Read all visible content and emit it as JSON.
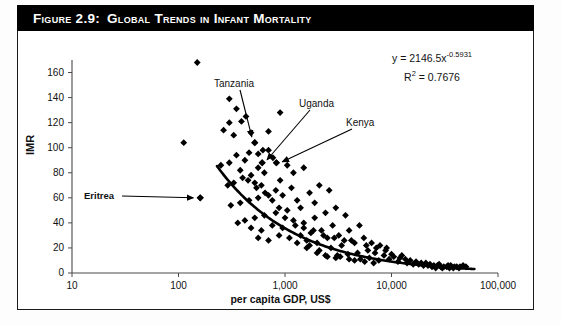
{
  "figure": {
    "number_label": "Figure 2.9:",
    "title": "Global Trends in Infant Mortality",
    "banner_color": "#000000",
    "banner_text_color": "#ffffff"
  },
  "equation": {
    "line1_prefix": "y = 2146.5x",
    "line1_exponent": "-0.5931",
    "line2_prefix": "R",
    "line2_exponent": "2",
    "line2_suffix": " = 0.7676"
  },
  "annotations": [
    {
      "name": "tanzania",
      "label": "Tanzania",
      "bold": false
    },
    {
      "name": "uganda",
      "label": "Uganda",
      "bold": false
    },
    {
      "name": "kenya",
      "label": "Kenya",
      "bold": false
    },
    {
      "name": "eritrea",
      "label": "Eritrea",
      "bold": true
    }
  ],
  "chart_data": {
    "type": "scatter",
    "title": "Global Trends in Infant Mortality",
    "xlabel": "per capita GDP, US$",
    "ylabel": "IMR",
    "xscale": "log",
    "yscale": "linear",
    "xlim": [
      10,
      100000
    ],
    "ylim": [
      0,
      170
    ],
    "xticks": [
      10,
      100,
      1000,
      10000,
      100000
    ],
    "xticklabels": [
      "10",
      "100",
      "1,000",
      "10,000",
      "100,000"
    ],
    "yticks": [
      0,
      20,
      40,
      60,
      80,
      100,
      120,
      140,
      160
    ],
    "yticklabels": [
      "0",
      "20",
      "40",
      "60",
      "80",
      "100",
      "120",
      "140",
      "160"
    ],
    "grid": false,
    "legend": "none",
    "marker": "diamond",
    "marker_color": "#000000",
    "trendline": {
      "type": "power",
      "equation": "y = 2146.5x^-0.5931",
      "r_squared": 0.7676,
      "coefficient": 2146.5,
      "exponent": -0.5931,
      "color": "#000000",
      "x_start": 230,
      "x_end": 60000
    },
    "annotated_points": [
      {
        "label": "Tanzania",
        "x": 520,
        "y": 104
      },
      {
        "label": "Uganda",
        "x": 610,
        "y": 88
      },
      {
        "label": "Kenya",
        "x": 830,
        "y": 88
      },
      {
        "label": "Eritrea",
        "x": 160,
        "y": 60
      }
    ],
    "points": [
      [
        150,
        168
      ],
      [
        112,
        104
      ],
      [
        160,
        60
      ],
      [
        300,
        139
      ],
      [
        350,
        131
      ],
      [
        300,
        120
      ],
      [
        390,
        121
      ],
      [
        430,
        125
      ],
      [
        265,
        114
      ],
      [
        330,
        110
      ],
      [
        520,
        104
      ],
      [
        480,
        112
      ],
      [
        610,
        88
      ],
      [
        830,
        88
      ],
      [
        700,
        113
      ],
      [
        900,
        128
      ],
      [
        620,
        98
      ],
      [
        560,
        95
      ],
      [
        460,
        96
      ],
      [
        420,
        90
      ],
      [
        350,
        94
      ],
      [
        300,
        88
      ],
      [
        250,
        86
      ],
      [
        700,
        98
      ],
      [
        770,
        92
      ],
      [
        560,
        84
      ],
      [
        640,
        80
      ],
      [
        480,
        78
      ],
      [
        400,
        76
      ],
      [
        330,
        72
      ],
      [
        290,
        70
      ],
      [
        520,
        72
      ],
      [
        600,
        70
      ],
      [
        900,
        74
      ],
      [
        1050,
        86
      ],
      [
        1200,
        80
      ],
      [
        820,
        66
      ],
      [
        700,
        62
      ],
      [
        560,
        60
      ],
      [
        460,
        58
      ],
      [
        380,
        56
      ],
      [
        310,
        54
      ],
      [
        1500,
        84
      ],
      [
        1150,
        68
      ],
      [
        950,
        62
      ],
      [
        1300,
        58
      ],
      [
        1700,
        64
      ],
      [
        2100,
        70
      ],
      [
        2600,
        66
      ],
      [
        1900,
        56
      ],
      [
        1400,
        52
      ],
      [
        1050,
        50
      ],
      [
        820,
        48
      ],
      [
        640,
        46
      ],
      [
        520,
        44
      ],
      [
        420,
        42
      ],
      [
        360,
        40
      ],
      [
        480,
        36
      ],
      [
        600,
        34
      ],
      [
        760,
        38
      ],
      [
        950,
        36
      ],
      [
        1200,
        42
      ],
      [
        1500,
        40
      ],
      [
        1900,
        44
      ],
      [
        2400,
        48
      ],
      [
        3000,
        52
      ],
      [
        3700,
        46
      ],
      [
        2800,
        38
      ],
      [
        2200,
        34
      ],
      [
        1750,
        32
      ],
      [
        1400,
        30
      ],
      [
        1100,
        28
      ],
      [
        880,
        30
      ],
      [
        700,
        26
      ],
      [
        560,
        28
      ],
      [
        1600,
        26
      ],
      [
        2000,
        24
      ],
      [
        2500,
        28
      ],
      [
        3200,
        30
      ],
      [
        4000,
        34
      ],
      [
        5000,
        38
      ],
      [
        4200,
        26
      ],
      [
        3400,
        22
      ],
      [
        2700,
        20
      ],
      [
        2100,
        18
      ],
      [
        1700,
        22
      ],
      [
        5500,
        28
      ],
      [
        6500,
        24
      ],
      [
        7800,
        22
      ],
      [
        9000,
        20
      ],
      [
        6000,
        18
      ],
      [
        4800,
        16
      ],
      [
        3900,
        15
      ],
      [
        3100,
        14
      ],
      [
        2500,
        13
      ],
      [
        7000,
        16
      ],
      [
        8500,
        14
      ],
      [
        10500,
        13
      ],
      [
        12000,
        12
      ],
      [
        9500,
        11
      ],
      [
        7600,
        10
      ],
      [
        6200,
        12
      ],
      [
        5100,
        11
      ],
      [
        13500,
        11
      ],
      [
        15000,
        10
      ],
      [
        17000,
        9
      ],
      [
        19000,
        8
      ],
      [
        21000,
        8
      ],
      [
        16000,
        7
      ],
      [
        14000,
        8
      ],
      [
        11500,
        9
      ],
      [
        23000,
        7
      ],
      [
        25000,
        6
      ],
      [
        27000,
        6
      ],
      [
        29000,
        5
      ],
      [
        31000,
        5
      ],
      [
        24000,
        5
      ],
      [
        22000,
        6
      ],
      [
        20000,
        6
      ],
      [
        18000,
        7
      ],
      [
        33000,
        5
      ],
      [
        35000,
        4
      ],
      [
        38000,
        4
      ],
      [
        41000,
        5
      ],
      [
        44000,
        5
      ],
      [
        36000,
        6
      ],
      [
        30000,
        4
      ],
      [
        26000,
        4
      ],
      [
        47000,
        6
      ],
      [
        50000,
        5
      ],
      [
        43000,
        4
      ],
      [
        39000,
        5
      ],
      [
        34000,
        6
      ],
      [
        28000,
        7
      ],
      [
        12500,
        14
      ],
      [
        10000,
        15
      ],
      [
        8800,
        18
      ],
      [
        7200,
        20
      ],
      [
        5800,
        22
      ],
      [
        4500,
        24
      ],
      [
        3600,
        26
      ],
      [
        2900,
        28
      ],
      [
        2300,
        30
      ],
      [
        1850,
        34
      ],
      [
        1500,
        36
      ],
      [
        1250,
        38
      ],
      [
        1000,
        44
      ],
      [
        880,
        52
      ],
      [
        760,
        58
      ],
      [
        650,
        64
      ],
      [
        540,
        68
      ],
      [
        450,
        74
      ],
      [
        380,
        82
      ],
      [
        1300,
        24
      ],
      [
        1600,
        20
      ],
      [
        2000,
        16
      ],
      [
        2400,
        14
      ],
      [
        3000,
        12
      ],
      [
        4500,
        10
      ],
      [
        5600,
        9
      ],
      [
        6800,
        8
      ],
      [
        4000,
        11
      ],
      [
        3300,
        13
      ]
    ]
  }
}
